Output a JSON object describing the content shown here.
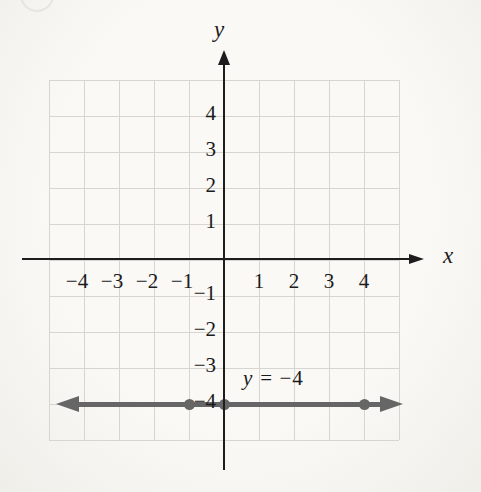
{
  "chart_data": {
    "type": "line",
    "title": "",
    "equation": "y = −4",
    "x_axis": {
      "label": "x",
      "range": [
        -5,
        5
      ],
      "ticks": [
        {
          "v": -4,
          "label": "−4"
        },
        {
          "v": -3,
          "label": "−3"
        },
        {
          "v": -2,
          "label": "−2"
        },
        {
          "v": -1,
          "label": "−1"
        },
        {
          "v": 1,
          "label": "1"
        },
        {
          "v": 2,
          "label": "2"
        },
        {
          "v": 3,
          "label": "3"
        },
        {
          "v": 4,
          "label": "4"
        }
      ]
    },
    "y_axis": {
      "label": "y",
      "range": [
        -5,
        5
      ],
      "ticks": [
        {
          "v": 4,
          "label": "4"
        },
        {
          "v": 3,
          "label": "3"
        },
        {
          "v": 2,
          "label": "2"
        },
        {
          "v": 1,
          "label": "1"
        },
        {
          "v": -1,
          "label": "−1"
        },
        {
          "v": -2,
          "label": "−2"
        },
        {
          "v": -3,
          "label": "−3"
        },
        {
          "v": -4,
          "label": "−4"
        }
      ]
    },
    "grid": {
      "visible": true,
      "x_step": 1,
      "y_step": 1
    },
    "series": [
      {
        "name": "y = −4",
        "kind": "horizontal-line",
        "y": -4,
        "arrows": "both",
        "marked_points": [
          [
            -1,
            -4
          ],
          [
            0,
            -4
          ],
          [
            4,
            -4
          ]
        ]
      }
    ]
  },
  "equation_label": {
    "variable": "y",
    "rest": "= −4"
  },
  "colors": {
    "background": "#faf9f6",
    "grid": "#d7d5d0",
    "axis": "#1d1d1d",
    "text": "#1b1b1b",
    "line": "#666666"
  }
}
